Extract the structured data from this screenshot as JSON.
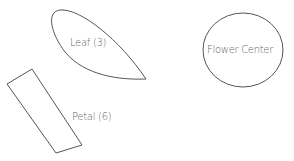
{
  "diagram": {
    "shapes": [
      {
        "id": "leaf",
        "label": "Leaf (3)",
        "type": "leaf"
      },
      {
        "id": "flower-center",
        "label": "Flower Center",
        "type": "ellipse"
      },
      {
        "id": "petal",
        "label": "Petal (6)",
        "type": "rectangle"
      }
    ],
    "colors": {
      "stroke": "#555555",
      "text": "#666666",
      "background": "#ffffff"
    }
  }
}
